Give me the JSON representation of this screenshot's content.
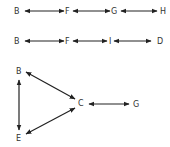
{
  "diagram": {
    "row1": {
      "nodes": [
        {
          "id": "B",
          "label": "B",
          "x": 17,
          "y": 14
        },
        {
          "id": "F",
          "label": "F",
          "x": 67,
          "y": 14
        },
        {
          "id": "G",
          "label": "G",
          "x": 113,
          "y": 14
        },
        {
          "id": "H",
          "label": "H",
          "x": 162,
          "y": 14
        }
      ],
      "edges": [
        {
          "from": "B",
          "to": "F",
          "type": "bidirectional"
        },
        {
          "from": "F",
          "to": "G",
          "type": "bidirectional"
        },
        {
          "from": "G",
          "to": "H",
          "type": "bidirectional"
        }
      ]
    },
    "row2": {
      "nodes": [
        {
          "id": "B",
          "label": "B",
          "x": 17,
          "y": 44
        },
        {
          "id": "F",
          "label": "F",
          "x": 67,
          "y": 44
        },
        {
          "id": "I",
          "label": "I",
          "x": 110,
          "y": 44
        },
        {
          "id": "D",
          "label": "D",
          "x": 160,
          "y": 44
        }
      ],
      "edges": [
        {
          "from": "B",
          "to": "F",
          "type": "bidirectional"
        },
        {
          "from": "F",
          "to": "I",
          "type": "bidirectional"
        },
        {
          "from": "I",
          "to": "D",
          "type": "bidirectional"
        }
      ]
    },
    "triangle": {
      "nodes": [
        {
          "id": "B",
          "label": "B",
          "x": 19,
          "y": 73
        },
        {
          "id": "C",
          "label": "C",
          "x": 81,
          "y": 107
        },
        {
          "id": "G",
          "label": "G",
          "x": 136,
          "y": 108
        },
        {
          "id": "E",
          "label": "E",
          "x": 19,
          "y": 139
        }
      ],
      "edges": [
        {
          "from": "B",
          "to": "C",
          "type": "bidirectional"
        },
        {
          "from": "B",
          "to": "E",
          "type": "bidirectional"
        },
        {
          "from": "E",
          "to": "C",
          "type": "bidirectional"
        },
        {
          "from": "C",
          "to": "G",
          "type": "bidirectional"
        }
      ]
    }
  }
}
